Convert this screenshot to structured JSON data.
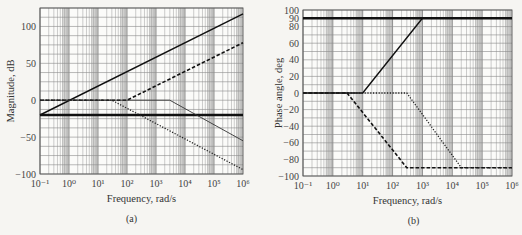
{
  "chart_data": [
    {
      "type": "line",
      "panel_label": "(a)",
      "title": "",
      "xlabel": "Frequency, rad/s",
      "ylabel": "Magnitude, dB",
      "xscale": "log",
      "xlim": [
        0.1,
        1000000
      ],
      "ylim": [
        -100,
        125
      ],
      "x_ticks": [
        "10⁻¹",
        "10⁰",
        "10¹",
        "10²",
        "10³",
        "10⁴",
        "10⁵",
        "10⁶"
      ],
      "y_ticks": [
        100,
        50,
        0,
        -50,
        -100
      ],
      "grid": true,
      "series": [
        {
          "name": "constant gain",
          "style": "thick-solid",
          "points": [
            [
              0.1,
              -20
            ],
            [
              1000000,
              -20
            ]
          ]
        },
        {
          "name": "zero at origin",
          "style": "solid",
          "points": [
            [
              0.1,
              -20
            ],
            [
              1000000,
              117
            ]
          ]
        },
        {
          "name": "zero (dashed)",
          "style": "dashed",
          "points": [
            [
              0.1,
              0
            ],
            [
              100,
              0
            ],
            [
              1000000,
              78
            ]
          ]
        },
        {
          "name": "pole (thin solid)",
          "style": "thin-solid",
          "points": [
            [
              0.1,
              0
            ],
            [
              3000,
              0
            ],
            [
              1000000,
              -55
            ]
          ]
        },
        {
          "name": "pole (dotted)",
          "style": "dotted",
          "points": [
            [
              0.1,
              0
            ],
            [
              30,
              0
            ],
            [
              1000000,
              -94
            ]
          ]
        }
      ]
    },
    {
      "type": "line",
      "panel_label": "(b)",
      "title": "",
      "xlabel": "Frequency, rad/s",
      "ylabel": "Phase angle, deg",
      "xscale": "log",
      "xlim": [
        0.1,
        1000000
      ],
      "ylim": [
        -100,
        100
      ],
      "x_ticks": [
        "10⁻¹",
        "10⁰",
        "10¹",
        "10²",
        "10³",
        "10⁴",
        "10⁵",
        "10⁶"
      ],
      "y_ticks": [
        100,
        90,
        80,
        60,
        40,
        20,
        0,
        -20,
        -40,
        -60,
        -80,
        -100
      ],
      "grid": true,
      "series": [
        {
          "name": "zero at origin",
          "style": "thick-solid",
          "points": [
            [
              0.1,
              90
            ],
            [
              1000000,
              90
            ]
          ]
        },
        {
          "name": "zero",
          "style": "solid",
          "points": [
            [
              0.1,
              0
            ],
            [
              10,
              0
            ],
            [
              1000,
              90
            ]
          ]
        },
        {
          "name": "pole (dashed)",
          "style": "dashed",
          "points": [
            [
              0.1,
              0
            ],
            [
              3,
              0
            ],
            [
              300,
              -90
            ],
            [
              1000000,
              -90
            ]
          ]
        },
        {
          "name": "pole (dotted)",
          "style": "dotted",
          "points": [
            [
              0.1,
              0
            ],
            [
              300,
              0
            ],
            [
              20000,
              -90
            ],
            [
              1000000,
              -90
            ]
          ]
        }
      ]
    }
  ]
}
